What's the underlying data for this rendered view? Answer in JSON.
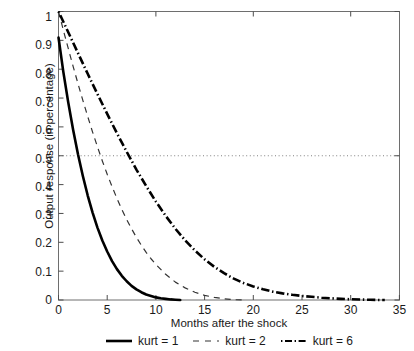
{
  "chart_data": {
    "type": "line",
    "title": "",
    "xlabel": "Months after the shock",
    "ylabel": "Output response (in percentage)",
    "xlim": [
      0,
      35
    ],
    "ylim": [
      0,
      1
    ],
    "xticks": [
      0,
      5,
      10,
      15,
      20,
      25,
      30,
      35
    ],
    "yticks": [
      0,
      0.1,
      0.2,
      0.3,
      0.4,
      0.5,
      0.6,
      0.7,
      0.8,
      0.9,
      1
    ],
    "ytick_labels": [
      "0",
      "0.1",
      "0.2",
      "0.3",
      "0.4",
      "0.5",
      "0.6",
      "0.7",
      "0.8",
      "0.9",
      "1"
    ],
    "xtick_labels": [
      "0",
      "5",
      "10",
      "15",
      "20",
      "25",
      "30",
      "35"
    ],
    "grid": false,
    "legend_position": "below-axes",
    "reference_lines": [
      {
        "name": "half-life-reference",
        "orientation": "horizontal",
        "value": 0.5,
        "style": "dotted",
        "color": "#808080"
      }
    ],
    "series": [
      {
        "name": "kurt = 1",
        "style": "solid",
        "color": "#000000",
        "width": 2.6,
        "x": [
          0,
          0.5,
          1,
          1.5,
          2,
          2.5,
          3,
          3.5,
          4,
          4.5,
          5,
          5.5,
          6,
          6.5,
          7,
          7.5,
          8,
          8.5,
          9,
          9.5,
          10,
          10.5,
          11,
          11.5,
          12,
          12.5
        ],
        "y": [
          0.91,
          0.79,
          0.685,
          0.59,
          0.505,
          0.43,
          0.362,
          0.303,
          0.251,
          0.206,
          0.168,
          0.135,
          0.107,
          0.084,
          0.065,
          0.049,
          0.037,
          0.027,
          0.019,
          0.014,
          0.009,
          0.006,
          0.004,
          0.002,
          0.001,
          0
        ]
      },
      {
        "name": "kurt = 2",
        "style": "dashed",
        "color": "#333333",
        "width": 1.2,
        "x": [
          0,
          0.5,
          1,
          1.5,
          2,
          2.5,
          3,
          3.5,
          4,
          4.5,
          5,
          5.5,
          6,
          6.5,
          7,
          7.5,
          8,
          8.5,
          9,
          9.5,
          10,
          11,
          12,
          13,
          14,
          15,
          16,
          17,
          18,
          19
        ],
        "y": [
          1.0,
          0.935,
          0.872,
          0.81,
          0.75,
          0.692,
          0.636,
          0.582,
          0.531,
          0.482,
          0.436,
          0.393,
          0.352,
          0.314,
          0.279,
          0.247,
          0.217,
          0.19,
          0.165,
          0.143,
          0.123,
          0.089,
          0.062,
          0.042,
          0.027,
          0.016,
          0.009,
          0.004,
          0.001,
          0
        ]
      },
      {
        "name": "kurt = 6",
        "style": "dashdot",
        "color": "#000000",
        "width": 2.6,
        "x": [
          0,
          1,
          2,
          3,
          4,
          5,
          6,
          7,
          8,
          9,
          10,
          11,
          12,
          13,
          14,
          15,
          16,
          17,
          18,
          19,
          20,
          21,
          22,
          23,
          24,
          25,
          26,
          27,
          28,
          29,
          30,
          31,
          32,
          33,
          33.5
        ],
        "y": [
          1.0,
          0.928,
          0.856,
          0.784,
          0.714,
          0.645,
          0.578,
          0.514,
          0.452,
          0.395,
          0.341,
          0.292,
          0.247,
          0.207,
          0.172,
          0.141,
          0.115,
          0.093,
          0.074,
          0.059,
          0.047,
          0.037,
          0.029,
          0.023,
          0.018,
          0.014,
          0.011,
          0.008,
          0.006,
          0.004,
          0.0025,
          0.0015,
          0.0007,
          0.0001,
          0
        ]
      }
    ]
  },
  "legend": {
    "entries": [
      {
        "label": "kurt = 1"
      },
      {
        "label": "kurt = 2"
      },
      {
        "label": "kurt = 6"
      }
    ]
  },
  "axes": {
    "frame_color": "#6e6e6e",
    "tick_color": "#4d4d4d"
  }
}
